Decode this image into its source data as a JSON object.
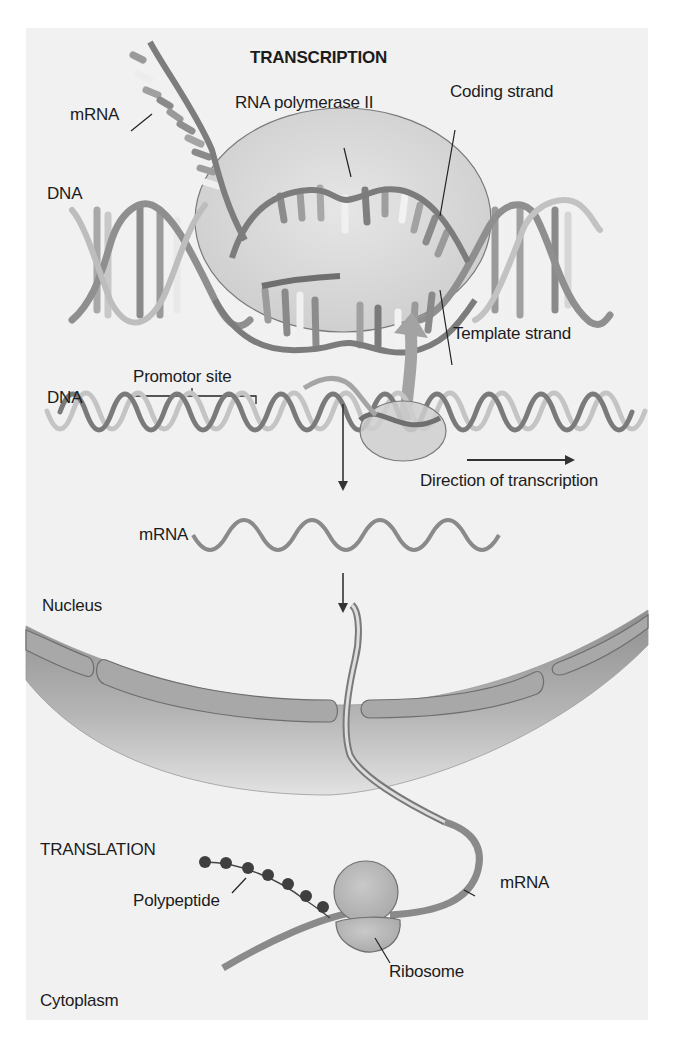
{
  "figure": {
    "title_transcription": "TRANSCRIPTION",
    "title_translation": "TRANSLATION",
    "colors": {
      "background": "#f1f1f1",
      "strand_dark": "#6f6f6f",
      "strand_light": "#b9b9b9",
      "polymerase_fill": "#d6d6d6",
      "envelope": "#9a9a9a",
      "text": "#1c1c1c"
    }
  },
  "transcription": {
    "labels": {
      "mrna": "mRNA",
      "rna_polymerase": "RNA polymerase II",
      "coding_strand": "Coding strand",
      "dna": "DNA",
      "template_strand": "Template strand"
    }
  },
  "gene_overview": {
    "labels": {
      "promotor_site": "Promotor site",
      "dna": "DNA",
      "direction": "Direction of transcription",
      "mrna": "mRNA",
      "nucleus": "Nucleus"
    }
  },
  "translation": {
    "labels": {
      "polypeptide": "Polypeptide",
      "mrna": "mRNA",
      "ribosome": "Ribosome",
      "cytoplasm": "Cytoplasm"
    },
    "polypeptide_bead_count": 7
  }
}
